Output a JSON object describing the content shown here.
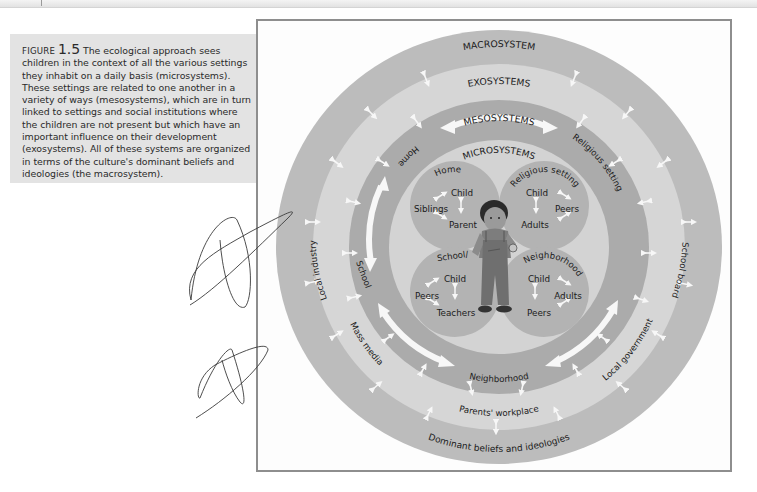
{
  "caption": {
    "figure_label": "FIGURE",
    "figure_number": "1.5",
    "text": "The ecological approach sees children in the context of all the various settings they inhabit on a daily basis (microsystems). These settings are related to one another in a variety of ways (mesosystems), which are in turn linked to settings and social institutions where the children are not present but which have an important influence on their development (exosystems). All of these systems are organized in terms of the culture's dominant beliefs and ideologies (the macrosystem)."
  },
  "diagram": {
    "colors": {
      "macro": "#bcbcbc",
      "exo": "#d6d6d6",
      "meso": "#ababab",
      "micro": "#d3d3d3",
      "quadrant": "#b3b3b3",
      "arrow": "#f7f7f7"
    },
    "rings": {
      "macro": {
        "title": "MACROSYSTEM",
        "labels": [
          "Dominant beliefs and ideologies"
        ]
      },
      "exo": {
        "title": "EXOSYSTEMS",
        "labels": [
          "Local industry",
          "School board",
          "Mass media",
          "Local government",
          "Parents' workplace"
        ]
      },
      "meso": {
        "title": "MESOSYSTEMS",
        "labels": [
          "Home",
          "Religious setting",
          "School",
          "Neighborhood"
        ]
      },
      "micro": {
        "title": "MICROSYSTEMS"
      }
    },
    "quadrants": [
      {
        "title": "Home",
        "members": [
          "Child",
          "Siblings",
          "Parent"
        ]
      },
      {
        "title": "Religious setting",
        "members": [
          "Child",
          "Peers",
          "Adults"
        ]
      },
      {
        "title": "School/",
        "members": [
          "Child",
          "Peers",
          "Teachers"
        ]
      },
      {
        "title": "Neighborhood",
        "members": [
          "Child",
          "Adults",
          "Peers"
        ]
      }
    ],
    "center_figure": "child-illustration"
  }
}
